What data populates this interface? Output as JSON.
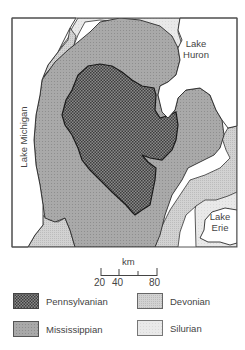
{
  "map": {
    "labels": {
      "lake_huron_line1": "Lake",
      "lake_huron_line2": "Huron",
      "lake_erie_line1": "Lake",
      "lake_erie_line2": "Erie",
      "lake_michigan": "Lake Michigan"
    },
    "colors": {
      "pennsylvanian": "#6a6a6a",
      "mississippian": "#a6a6a6",
      "devonian": "#cdcdcd",
      "silurian": "#e6e6e6",
      "water": "#ffffff",
      "border": "#2a2a2a"
    }
  },
  "scale_bar": {
    "unit": "km",
    "ticks": [
      "20",
      "40",
      "80"
    ]
  },
  "legend": {
    "items": [
      {
        "label": "Pennsylvanian",
        "key": "pennsylvanian"
      },
      {
        "label": "Devonian",
        "key": "devonian"
      },
      {
        "label": "Mississippian",
        "key": "mississippian"
      },
      {
        "label": "Silurian",
        "key": "silurian"
      }
    ]
  }
}
